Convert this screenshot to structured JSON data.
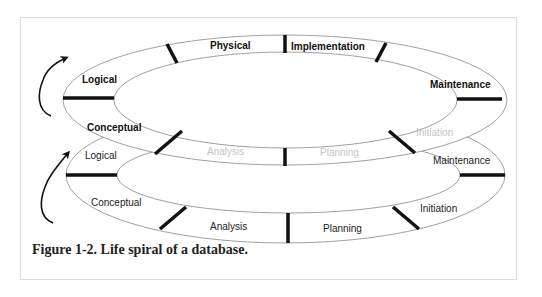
{
  "figure": {
    "caption": "Figure 1-2. Life spiral of a database.",
    "colors": {
      "stroke": "#888888",
      "tick": "#111111",
      "text_bold": "#111111",
      "text_regular": "#222222",
      "text_faint": "#c4c4c4",
      "frame_border": "#dcdcdc"
    }
  },
  "upper_cycle": {
    "stages": [
      {
        "label": "Logical",
        "style": "bold"
      },
      {
        "label": "Physical",
        "style": "bold"
      },
      {
        "label": "Implementation",
        "style": "bold"
      },
      {
        "label": "Maintenance",
        "style": "bold"
      },
      {
        "label": "Conceptual",
        "style": "bold"
      },
      {
        "label": "Analysis",
        "style": "faint"
      },
      {
        "label": "Planning",
        "style": "faint"
      },
      {
        "label": "Initiation",
        "style": "faint"
      }
    ]
  },
  "lower_cycle": {
    "stages": [
      {
        "label": "Logical",
        "style": "regular"
      },
      {
        "label": "Maintenance",
        "style": "regular"
      },
      {
        "label": "Conceptual",
        "style": "regular"
      },
      {
        "label": "Analysis",
        "style": "regular"
      },
      {
        "label": "Planning",
        "style": "regular"
      },
      {
        "label": "Initiation",
        "style": "regular"
      }
    ]
  },
  "arrows": [
    {
      "name": "upper-cycle-arrow",
      "direction": "up"
    },
    {
      "name": "lower-cycle-arrow",
      "direction": "up"
    }
  ]
}
